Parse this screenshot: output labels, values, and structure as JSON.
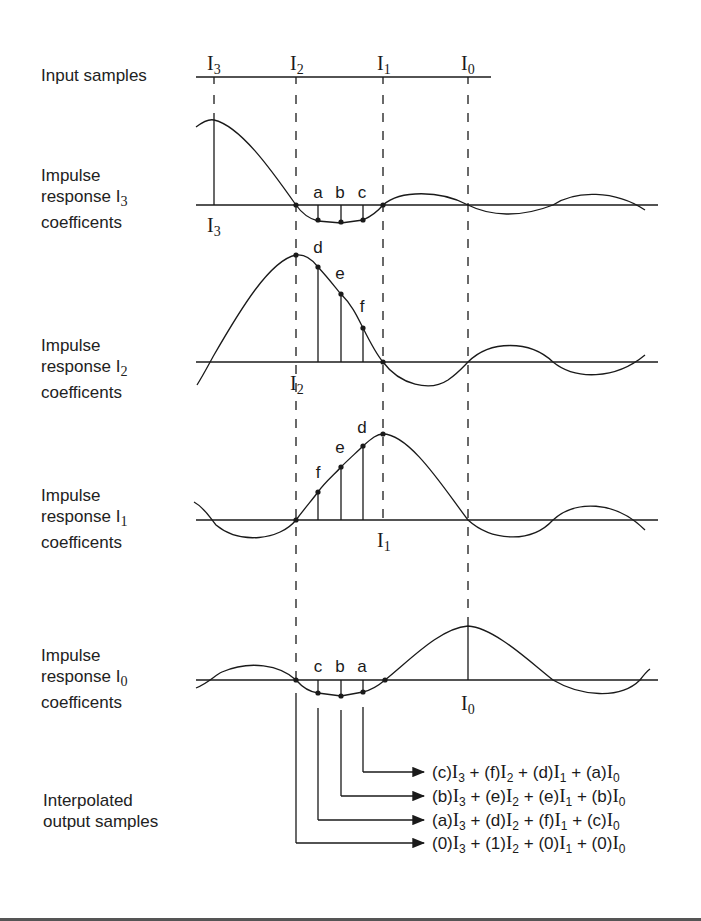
{
  "row_labels": {
    "input": "Input samples",
    "impulse_I3": {
      "line1": "Impulse",
      "line2": "response I",
      "sub": "3",
      "line3": "coefficents"
    },
    "impulse_I2": {
      "line1": "Impulse",
      "line2": "response I",
      "sub": "2",
      "line3": "coefficents"
    },
    "impulse_I1": {
      "line1": "Impulse",
      "line2": "response I",
      "sub": "1",
      "line3": "coefficents"
    },
    "impulse_I0": {
      "line1": "Impulse",
      "line2": "response I",
      "sub": "0",
      "line3": "coefficents"
    },
    "output": {
      "line1": "Interpolated",
      "line2": "output samples"
    }
  },
  "input_samples": [
    {
      "name": "I",
      "sub": "3"
    },
    {
      "name": "I",
      "sub": "2"
    },
    {
      "name": "I",
      "sub": "1"
    },
    {
      "name": "I",
      "sub": "0"
    }
  ],
  "coefficient_points": {
    "row_I3": [
      "a",
      "b",
      "c"
    ],
    "row_I2": [
      "d",
      "e",
      "f"
    ],
    "row_I1": [
      "f",
      "e",
      "d"
    ],
    "row_I0": [
      "c",
      "b",
      "a"
    ]
  },
  "sample_markers": {
    "row_I3": {
      "name": "I",
      "sub": "3"
    },
    "row_I2": {
      "name": "I",
      "sub": "2"
    },
    "row_I1": {
      "name": "I",
      "sub": "1"
    },
    "row_I0": {
      "name": "I",
      "sub": "0"
    }
  },
  "output_equations": [
    {
      "terms": [
        {
          "coef": "(c)",
          "sub": "3"
        },
        {
          "coef": "(f)",
          "sub": "2"
        },
        {
          "coef": "(d)",
          "sub": "1"
        },
        {
          "coef": "(a)",
          "sub": "0"
        }
      ]
    },
    {
      "terms": [
        {
          "coef": "(b)",
          "sub": "3"
        },
        {
          "coef": "(e)",
          "sub": "2"
        },
        {
          "coef": "(e)",
          "sub": "1"
        },
        {
          "coef": "(b)",
          "sub": "0"
        }
      ]
    },
    {
      "terms": [
        {
          "coef": "(a)",
          "sub": "3"
        },
        {
          "coef": "(d)",
          "sub": "2"
        },
        {
          "coef": "(f)",
          "sub": "1"
        },
        {
          "coef": "(c)",
          "sub": "0"
        }
      ]
    },
    {
      "terms": [
        {
          "coef": "(0)",
          "sub": "3"
        },
        {
          "coef": "(1)",
          "sub": "2"
        },
        {
          "coef": "(0)",
          "sub": "1"
        },
        {
          "coef": "(0)",
          "sub": "0"
        }
      ]
    }
  ],
  "symbols": {
    "I": "I",
    "plus": "+"
  },
  "colors": {
    "ink": "#1a1a1a",
    "background": "#ffffff"
  }
}
